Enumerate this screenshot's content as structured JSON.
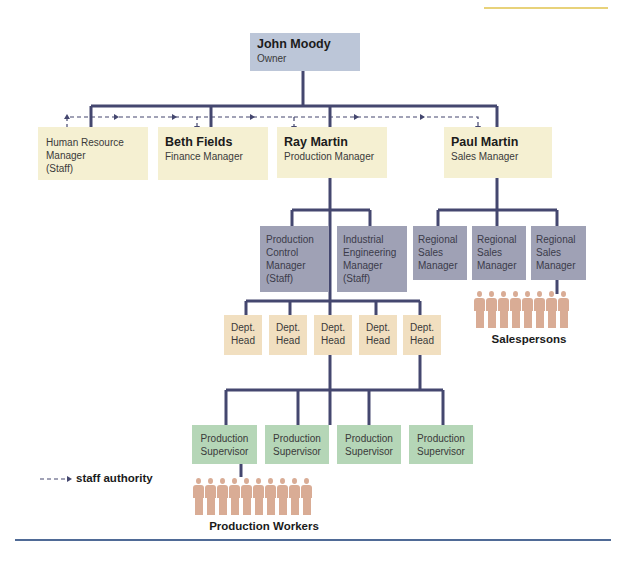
{
  "colors": {
    "owner_box": "#bcc6d8",
    "manager_box": "#f5f0d2",
    "staff_box": "#9fa1b5",
    "dept_head_box": "#f1dfc0",
    "supervisor_box": "#b5d6b7",
    "connector": "#44476f",
    "people": "#d9ac95",
    "top_rule": "#e8d27a",
    "bottom_rule": "#4f6a96"
  },
  "owner": {
    "name": "John Moody",
    "title": "Owner"
  },
  "managers": [
    {
      "name": "",
      "title_lines": [
        "Human Resource",
        "Manager",
        "(Staff)"
      ]
    },
    {
      "name": "Beth Fields",
      "title": "Finance Manager"
    },
    {
      "name": "Ray Martin",
      "title": "Production Manager"
    },
    {
      "name": "Paul Martin",
      "title": "Sales Manager"
    }
  ],
  "production_staff": [
    {
      "lines": [
        "Production",
        "Control",
        "Manager",
        "(Staff)"
      ]
    },
    {
      "lines": [
        "Industrial",
        "Engineering",
        "Manager",
        "(Staff)"
      ]
    }
  ],
  "regional_sales": [
    {
      "lines": [
        "Regional",
        "Sales",
        "Manager"
      ]
    },
    {
      "lines": [
        "Regional",
        "Sales",
        "Manager"
      ]
    },
    {
      "lines": [
        "Regional",
        "Sales",
        "Manager"
      ]
    }
  ],
  "dept_heads": [
    {
      "lines": [
        "Dept.",
        "Head"
      ]
    },
    {
      "lines": [
        "Dept.",
        "Head"
      ]
    },
    {
      "lines": [
        "Dept.",
        "Head"
      ]
    },
    {
      "lines": [
        "Dept.",
        "Head"
      ]
    },
    {
      "lines": [
        "Dept.",
        "Head"
      ]
    }
  ],
  "supervisors": [
    {
      "lines": [
        "Production",
        "Supervisor"
      ]
    },
    {
      "lines": [
        "Production",
        "Supervisor"
      ]
    },
    {
      "lines": [
        "Production",
        "Supervisor"
      ]
    },
    {
      "lines": [
        "Production",
        "Supervisor"
      ]
    }
  ],
  "salespersons": {
    "label": "Salespersons",
    "count": 8
  },
  "production_workers": {
    "label": "Production Workers",
    "count": 10
  },
  "legend": {
    "label": "staff authority",
    "symbol": "dashed-arrow"
  }
}
